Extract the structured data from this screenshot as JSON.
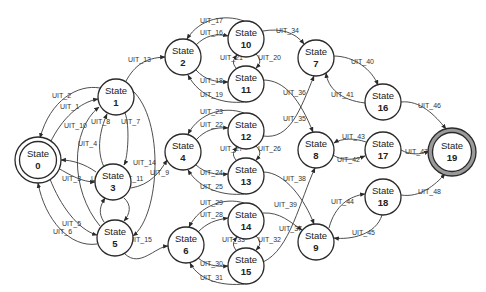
{
  "diagram": {
    "title": "",
    "state_prefix": "State",
    "nodes": [
      {
        "id": "0",
        "label": "State",
        "num": "0",
        "x": 38,
        "y": 160,
        "type": "initial"
      },
      {
        "id": "1",
        "label": "State",
        "num": "1",
        "x": 116,
        "y": 97,
        "type": "normal"
      },
      {
        "id": "2",
        "label": "State",
        "num": "2",
        "x": 183,
        "y": 57,
        "type": "normal"
      },
      {
        "id": "3",
        "label": "State",
        "num": "3",
        "x": 113,
        "y": 182,
        "type": "normal"
      },
      {
        "id": "4",
        "label": "State",
        "num": "4",
        "x": 183,
        "y": 152,
        "type": "normal"
      },
      {
        "id": "5",
        "label": "State",
        "num": "5",
        "x": 115,
        "y": 238,
        "type": "normal"
      },
      {
        "id": "6",
        "label": "State",
        "num": "6",
        "x": 186,
        "y": 245,
        "type": "normal"
      },
      {
        "id": "7",
        "label": "State",
        "num": "7",
        "x": 316,
        "y": 58,
        "type": "normal"
      },
      {
        "id": "8",
        "label": "State",
        "num": "8",
        "x": 316,
        "y": 150,
        "type": "normal"
      },
      {
        "id": "9",
        "label": "State",
        "num": "9",
        "x": 316,
        "y": 242,
        "type": "normal"
      },
      {
        "id": "10",
        "label": "State",
        "num": "10",
        "x": 246,
        "y": 39,
        "type": "normal"
      },
      {
        "id": "11",
        "label": "State",
        "num": "11",
        "x": 246,
        "y": 84,
        "type": "normal"
      },
      {
        "id": "12",
        "label": "State",
        "num": "12",
        "x": 246,
        "y": 131,
        "type": "normal"
      },
      {
        "id": "13",
        "label": "State",
        "num": "13",
        "x": 246,
        "y": 176,
        "type": "normal"
      },
      {
        "id": "14",
        "label": "State",
        "num": "14",
        "x": 246,
        "y": 221,
        "type": "normal"
      },
      {
        "id": "15",
        "label": "State",
        "num": "15",
        "x": 246,
        "y": 266,
        "type": "normal"
      },
      {
        "id": "16",
        "label": "State",
        "num": "16",
        "x": 383,
        "y": 102,
        "type": "normal"
      },
      {
        "id": "17",
        "label": "State",
        "num": "17",
        "x": 383,
        "y": 150,
        "type": "normal"
      },
      {
        "id": "18",
        "label": "State",
        "num": "18",
        "x": 383,
        "y": 197,
        "type": "normal"
      },
      {
        "id": "19",
        "label": "State",
        "num": "19",
        "x": 452,
        "y": 152,
        "type": "final"
      }
    ],
    "edges": [
      {
        "id": "UIT_1",
        "from": "0",
        "to": "1"
      },
      {
        "id": "UIT_2",
        "from": "1",
        "to": "0"
      },
      {
        "id": "UIT_3",
        "from": "0",
        "to": "3"
      },
      {
        "id": "UIT_4",
        "from": "3",
        "to": "0"
      },
      {
        "id": "UIT_5",
        "from": "0",
        "to": "5"
      },
      {
        "id": "UIT_6",
        "from": "5",
        "to": "0"
      },
      {
        "id": "UIT_7",
        "from": "1",
        "to": "3"
      },
      {
        "id": "UIT_8",
        "from": "3",
        "to": "1"
      },
      {
        "id": "UIT_9",
        "from": "1",
        "to": "5"
      },
      {
        "id": "UIT_10",
        "from": "5",
        "to": "1"
      },
      {
        "id": "UIT_11",
        "from": "3",
        "to": "5"
      },
      {
        "id": "UIT_12",
        "from": "5",
        "to": "3"
      },
      {
        "id": "UIT_13",
        "from": "1",
        "to": "2"
      },
      {
        "id": "UIT_14",
        "from": "3",
        "to": "4"
      },
      {
        "id": "UIT_15",
        "from": "5",
        "to": "6"
      },
      {
        "id": "UIT_16",
        "from": "2",
        "to": "10"
      },
      {
        "id": "UIT_17",
        "from": "10",
        "to": "2"
      },
      {
        "id": "UIT_18",
        "from": "2",
        "to": "11"
      },
      {
        "id": "UIT_19",
        "from": "11",
        "to": "2"
      },
      {
        "id": "UIT_20",
        "from": "10",
        "to": "11"
      },
      {
        "id": "UIT_21",
        "from": "11",
        "to": "10"
      },
      {
        "id": "UIT_22",
        "from": "4",
        "to": "12"
      },
      {
        "id": "UIT_23",
        "from": "12",
        "to": "4"
      },
      {
        "id": "UIT_24",
        "from": "4",
        "to": "13"
      },
      {
        "id": "UIT_25",
        "from": "13",
        "to": "4"
      },
      {
        "id": "UIT_26",
        "from": "12",
        "to": "13"
      },
      {
        "id": "UIT_27",
        "from": "13",
        "to": "12"
      },
      {
        "id": "UIT_28",
        "from": "6",
        "to": "14"
      },
      {
        "id": "UIT_29",
        "from": "14",
        "to": "6"
      },
      {
        "id": "UIT_30",
        "from": "6",
        "to": "15"
      },
      {
        "id": "UIT_31",
        "from": "15",
        "to": "6"
      },
      {
        "id": "UIT_32",
        "from": "14",
        "to": "15"
      },
      {
        "id": "UIT_33",
        "from": "15",
        "to": "14"
      },
      {
        "id": "UIT_34",
        "from": "10",
        "to": "7"
      },
      {
        "id": "UIT_35",
        "from": "12",
        "to": "7"
      },
      {
        "id": "UIT_36",
        "from": "11",
        "to": "8"
      },
      {
        "id": "UIT_37",
        "from": "15",
        "to": "8"
      },
      {
        "id": "UIT_38",
        "from": "13",
        "to": "9"
      },
      {
        "id": "UIT_39",
        "from": "14",
        "to": "9"
      },
      {
        "id": "UIT_40",
        "from": "7",
        "to": "16"
      },
      {
        "id": "UIT_41",
        "from": "16",
        "to": "7"
      },
      {
        "id": "UIT_42",
        "from": "8",
        "to": "17"
      },
      {
        "id": "UIT_43",
        "from": "17",
        "to": "8"
      },
      {
        "id": "UIT_44",
        "from": "9",
        "to": "18"
      },
      {
        "id": "UIT_45",
        "from": "18",
        "to": "9"
      },
      {
        "id": "UIT_46",
        "from": "16",
        "to": "19"
      },
      {
        "id": "UIT_47",
        "from": "17",
        "to": "19"
      },
      {
        "id": "UIT_48",
        "from": "18",
        "to": "19"
      }
    ]
  }
}
